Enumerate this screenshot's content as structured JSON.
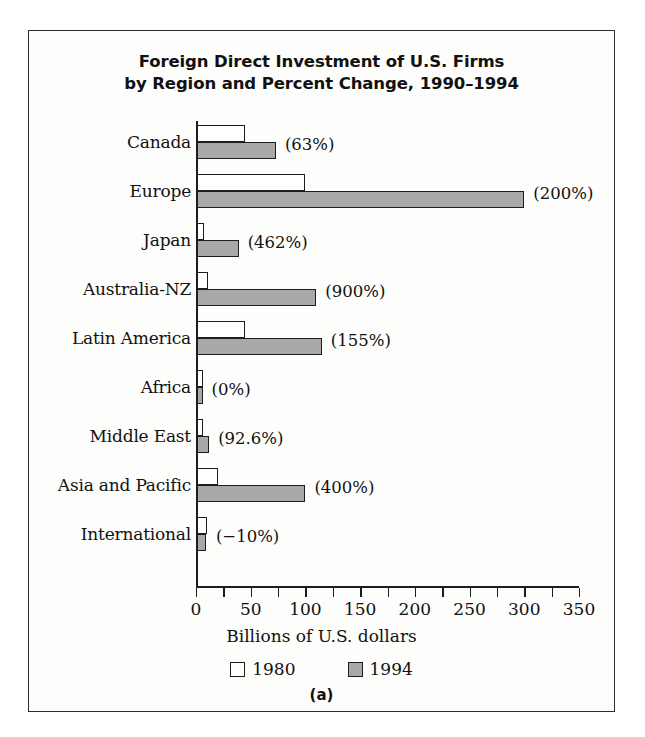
{
  "figure": {
    "caption": "(a)",
    "border_color": "#2b2b2b",
    "background_color": "#fdfdfb"
  },
  "chart_data": {
    "type": "bar",
    "orientation": "horizontal",
    "title": "Foreign Direct Investment of U.S. Firms by Region and Percent Change, 1990–1994",
    "title_line1": "Foreign Direct Investment of U.S. Firms",
    "title_line2": "by Region and Percent Change, 1990–1994",
    "xlabel": "Billions of U.S. dollars",
    "ylabel": "",
    "xlim": [
      0,
      350
    ],
    "xticks": [
      0,
      50,
      100,
      150,
      200,
      250,
      300,
      350
    ],
    "xtick_labels": [
      "0",
      "50",
      "100",
      "150",
      "200",
      "250",
      "300",
      "350"
    ],
    "minor_tick_step": 25,
    "grid": false,
    "legend_position": "bottom",
    "categories": [
      "Canada",
      "Europe",
      "Japan",
      "Australia-NZ",
      "Latin America",
      "Africa",
      "Middle East",
      "Asia and Pacific",
      "International"
    ],
    "series": [
      {
        "name": "1980",
        "color": "#ffffff",
        "edge_color": "#1d1d1d",
        "values": [
          45,
          100,
          7,
          11,
          45,
          6,
          6,
          20,
          10
        ]
      },
      {
        "name": "1994",
        "color": "#a8a8a8",
        "edge_color": "#1d1d1d",
        "values": [
          73,
          300,
          39,
          110,
          115,
          6,
          12,
          100,
          9
        ]
      }
    ],
    "annotations": [
      "(63%)",
      "(200%)",
      "(462%)",
      "(900%)",
      "(155%)",
      "(0%)",
      "(92.6%)",
      "(400%)",
      "(−10%)"
    ]
  }
}
